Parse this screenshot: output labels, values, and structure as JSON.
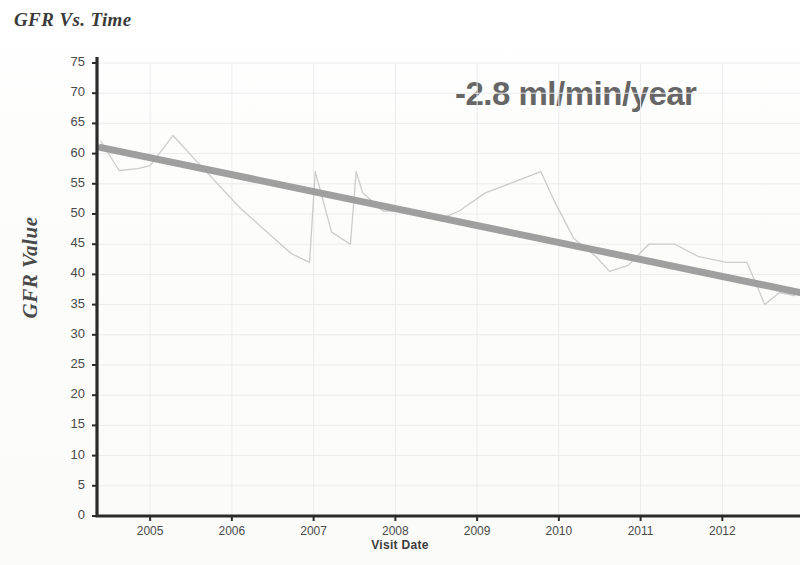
{
  "title": "GFR Vs. Time",
  "annotation": "-2.8 ml/min/year",
  "axis": {
    "ylabel": "GFR Value",
    "xlabel": "Visit Date"
  },
  "colors": {
    "trendline": "#9a9a9a",
    "dataline": "#c9c9c9",
    "axis": "#2b2b2b",
    "grid": "#ececed",
    "annotation": "#666666",
    "text": "#4a4a4a"
  },
  "chart_data": {
    "type": "line",
    "title": "GFR Vs. Time",
    "xlabel": "Visit Date",
    "ylabel": "GFR Value",
    "xlim": [
      2004.35,
      2012.95
    ],
    "ylim": [
      0,
      75
    ],
    "ytick_labels": [
      "0",
      "5",
      "10",
      "15",
      "20",
      "25",
      "30",
      "35",
      "40",
      "45",
      "50",
      "55",
      "60",
      "65",
      "70",
      "75"
    ],
    "yticks": [
      0,
      5,
      10,
      15,
      20,
      25,
      30,
      35,
      40,
      45,
      50,
      55,
      60,
      65,
      70,
      75
    ],
    "xtick_labels": [
      "2005",
      "2006",
      "2007",
      "2008",
      "2009",
      "2010",
      "2011",
      "2012"
    ],
    "xticks": [
      2005,
      2006,
      2007,
      2008,
      2009,
      2010,
      2011,
      2012
    ],
    "grid": true,
    "legend": false,
    "annotations": [
      {
        "text": "-2.8 ml/min/year",
        "x": 2009.7,
        "y": 70
      }
    ],
    "series": [
      {
        "name": "GFR Value",
        "style": "thin-line",
        "color": "#c9c9c9",
        "x": [
          2004.4,
          2004.62,
          2004.85,
          2005.0,
          2005.28,
          2005.55,
          2006.1,
          2006.72,
          2006.95,
          2007.02,
          2007.22,
          2007.45,
          2007.52,
          2007.6,
          2007.85,
          2008.15,
          2008.52,
          2008.78,
          2009.1,
          2009.78,
          2009.95,
          2010.18,
          2010.45,
          2010.62,
          2010.85,
          2011.1,
          2011.42,
          2011.7,
          2012.05,
          2012.3,
          2012.52,
          2012.7,
          2012.88
        ],
        "y": [
          62.0,
          57.2,
          57.5,
          58.0,
          63.0,
          59.0,
          51.0,
          43.5,
          42.0,
          57.0,
          47.0,
          45.0,
          57.0,
          53.5,
          50.5,
          50.5,
          49.0,
          50.5,
          53.5,
          57.0,
          52.0,
          46.0,
          43.0,
          40.5,
          41.5,
          45.0,
          45.0,
          43.0,
          42.0,
          42.0,
          35.0,
          37.0,
          36.5
        ]
      },
      {
        "name": "Linear trend",
        "style": "thick-line",
        "color": "#9a9a9a",
        "slope_per_year": -2.8,
        "x": [
          2004.4,
          2012.95
        ],
        "y": [
          61.0,
          37.0
        ]
      }
    ]
  }
}
